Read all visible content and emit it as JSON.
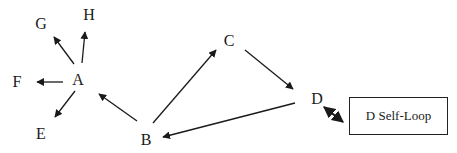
{
  "diagram": {
    "type": "directed-graph",
    "nodes": [
      {
        "id": "A",
        "label": "A",
        "x": 78,
        "y": 80
      },
      {
        "id": "B",
        "label": "B",
        "x": 146,
        "y": 140
      },
      {
        "id": "C",
        "label": "C",
        "x": 229,
        "y": 41
      },
      {
        "id": "D",
        "label": "D",
        "x": 317,
        "y": 99
      },
      {
        "id": "E",
        "label": "E",
        "x": 41,
        "y": 134
      },
      {
        "id": "F",
        "label": "F",
        "x": 17,
        "y": 82
      },
      {
        "id": "G",
        "label": "G",
        "x": 41,
        "y": 24
      },
      {
        "id": "H",
        "label": "H",
        "x": 89,
        "y": 15
      }
    ],
    "edges": [
      {
        "from": "A",
        "to": "G",
        "x1": 74,
        "y1": 64,
        "x2": 54,
        "y2": 37
      },
      {
        "from": "A",
        "to": "H",
        "x1": 82,
        "y1": 63,
        "x2": 85,
        "y2": 32
      },
      {
        "from": "A",
        "to": "F",
        "x1": 63,
        "y1": 82,
        "x2": 37,
        "y2": 82
      },
      {
        "from": "A",
        "to": "E",
        "x1": 75,
        "y1": 91,
        "x2": 55,
        "y2": 117
      },
      {
        "from": "B",
        "to": "A",
        "x1": 137,
        "y1": 121,
        "x2": 99,
        "y2": 94
      },
      {
        "from": "B",
        "to": "C",
        "x1": 153,
        "y1": 123,
        "x2": 216,
        "y2": 50
      },
      {
        "from": "C",
        "to": "D",
        "x1": 245,
        "y1": 50,
        "x2": 293,
        "y2": 89
      },
      {
        "from": "D",
        "to": "B",
        "x1": 295,
        "y1": 103,
        "x2": 163,
        "y2": 137
      }
    ],
    "self_loop": {
      "node": "D",
      "label": "D Self-Loop",
      "box": {
        "x": 349,
        "y": 97,
        "width": 99,
        "height": 38
      },
      "arrow": {
        "x1": 324,
        "y1": 107,
        "x2": 343,
        "y2": 122,
        "bidirectional": true
      }
    },
    "colors": {
      "stroke": "#1a1a1a",
      "background": "#ffffff"
    }
  }
}
